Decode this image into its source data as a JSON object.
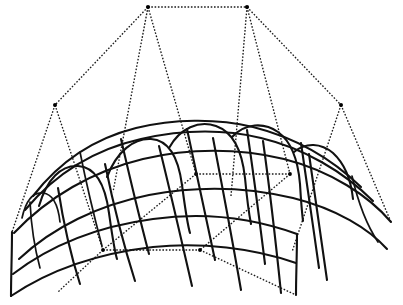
{
  "figure": {
    "type": "3d-wireframe-surface",
    "background_color": "#ffffff",
    "surface_line_color": "#111111",
    "control_polygon_color": "#1b1b1b",
    "control_polygon_style": "dotted",
    "canvas": {
      "width": 403,
      "height": 305
    }
  },
  "geometry": {
    "description": "Doubly curved vaulted surface drawn as a net of isoparametric curves, with an open dotted control polygon rising above and behind it.",
    "control_points": [
      {
        "name": "cp-top-left",
        "x": 148,
        "y": 7
      },
      {
        "name": "cp-top-right",
        "x": 247,
        "y": 7
      },
      {
        "name": "cp-left-shoulder",
        "x": 55,
        "y": 105
      },
      {
        "name": "cp-right-shoulder",
        "x": 341,
        "y": 105
      },
      {
        "name": "cp-mid-left",
        "x": 196,
        "y": 174
      },
      {
        "name": "cp-mid-right",
        "x": 290,
        "y": 174
      },
      {
        "name": "cp-low-left",
        "x": 103,
        "y": 250
      },
      {
        "name": "cp-low-right",
        "x": 200,
        "y": 250
      }
    ],
    "surface_corners": [
      {
        "name": "corner-bottom-left",
        "x": 11,
        "y": 296
      },
      {
        "name": "corner-bottom-right",
        "x": 296,
        "y": 295
      },
      {
        "name": "corner-left-tip",
        "x": 12,
        "y": 232
      },
      {
        "name": "corner-right-tip",
        "x": 391,
        "y": 222
      }
    ],
    "control_polygon_edges": [
      [
        "cp-top-left",
        "cp-top-right"
      ],
      [
        "cp-top-left",
        "cp-left-shoulder"
      ],
      [
        "cp-top-right",
        "cp-right-shoulder"
      ],
      [
        "cp-top-left",
        "cp-mid-left"
      ],
      [
        "cp-top-right",
        "cp-mid-right"
      ],
      [
        "cp-left-shoulder",
        "cp-low-left"
      ],
      [
        "cp-right-shoulder",
        "cp-low-right"
      ],
      [
        "cp-mid-left",
        "cp-mid-right"
      ],
      [
        "cp-mid-left",
        "cp-low-left"
      ],
      [
        "cp-mid-right",
        "cp-low-right"
      ],
      [
        "cp-low-left",
        "cp-low-right"
      ]
    ],
    "u_isocurve_count": 7,
    "v_isocurve_count": 5,
    "arch_count": 4
  },
  "paths": {
    "control_polygon": [
      "M148,7 L247,7",
      "M148,7 L55,105",
      "M247,7 L341,105",
      "M148,7 L196,174",
      "M247,7 L290,174",
      "M148,7 L110,186",
      "M247,7 L228,188",
      "M55,105 L103,250",
      "M341,105 L290,250",
      "M55,105 L12,232",
      "M341,105 L391,222",
      "M196,174 L290,174",
      "M196,174 L103,250",
      "M290,174 L200,250",
      "M103,250 L200,250",
      "M200,250 L296,295",
      "M103,250 L60,293"
    ],
    "surface_top_edge": "M33,194 C60,160 95,138 135,128 C172,119 215,118 252,127 C292,137 330,158 360,186",
    "surface_second_edge": "M25,208 C55,172 95,148 140,138 C180,129 222,128 260,137 C302,147 342,170 372,200",
    "surface_third_edge": "M14,232 C48,196 92,170 142,158 C188,147 238,147 283,158 C330,170 368,195 391,222",
    "surface_fourth_edge": "M18,258 C52,226 98,204 148,194 C195,185 246,186 292,197 C336,208 368,228 386,248",
    "surface_bottom_edge": "M11,296 C50,268 100,252 152,246 C200,241 252,247 296,262",
    "surface_lower_belt": "M13,273 C52,243 100,225 152,218 C202,211 252,217 296,233",
    "arches": [
      "M40,205 C48,178 62,165 78,166 C94,167 104,182 108,212 C111,233 113,248 116,258",
      "M108,176 C118,150 134,138 150,139 C166,140 177,154 181,184 C184,206 186,222 189,232",
      "M222,137 C234,122 252,120 266,129 C280,138 286,156 288,180",
      "M290,152 C302,141 318,142 330,152 C342,162 348,178 350,196"
    ],
    "v_curves": [
      "M57,190 C62,218 68,250 78,282",
      "M104,166 C112,200 122,240 134,280",
      "M158,148 C168,186 180,232 192,284",
      "M212,140 C220,180 230,230 240,288",
      "M262,143 C268,184 274,232 280,292",
      "M308,156 C314,196 320,240 326,284"
    ],
    "v_curves_short": [
      "M120,140 C128,176 138,218 148,256",
      "M186,130 C194,168 204,214 214,262",
      "M246,131 C252,172 258,218 264,266",
      "M300,145 C306,186 312,230 318,272"
    ]
  },
  "labels": {
    "caption": ""
  }
}
